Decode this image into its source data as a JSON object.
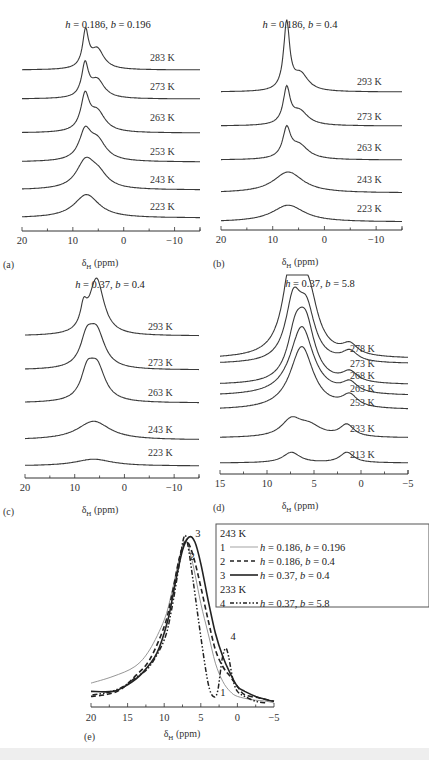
{
  "chart_data": [
    {
      "panel": "(a)",
      "type": "line",
      "title": "h = 0.186, b = 0.196",
      "title_parts": {
        "h": "0.186",
        "b": "0.196"
      },
      "xlabel": "δH (ppm)",
      "xlim": [
        20,
        -15
      ],
      "xticks": [
        20,
        10,
        0,
        -10
      ],
      "xtick_labels": [
        "20",
        "10",
        "0",
        "−10"
      ],
      "series": [
        {
          "name": "283 K",
          "peaks": [
            {
              "x": 7.5,
              "h": 1.0,
              "w": 0.7
            },
            {
              "x": 5.2,
              "h": 0.55,
              "w": 1.6
            }
          ],
          "base": 0.08
        },
        {
          "name": "273 K",
          "peaks": [
            {
              "x": 7.6,
              "h": 0.9,
              "w": 0.8
            },
            {
              "x": 5.2,
              "h": 0.5,
              "w": 1.7
            }
          ],
          "base": 0.08
        },
        {
          "name": "263 K",
          "peaks": [
            {
              "x": 7.6,
              "h": 0.95,
              "w": 1.0
            },
            {
              "x": 5.2,
              "h": 0.55,
              "w": 1.9
            }
          ],
          "base": 0.08
        },
        {
          "name": "253 K",
          "peaks": [
            {
              "x": 7.6,
              "h": 0.75,
              "w": 1.4
            },
            {
              "x": 5.2,
              "h": 0.55,
              "w": 2.1
            }
          ],
          "base": 0.08
        },
        {
          "name": "243 K",
          "peaks": [
            {
              "x": 7.5,
              "h": 0.75,
              "w": 2.2
            },
            {
              "x": 5.0,
              "h": 0.35,
              "w": 2.2
            }
          ],
          "base": 0.08
        },
        {
          "name": "223 K",
          "peaks": [
            {
              "x": 7.3,
              "h": 0.65,
              "w": 3.0
            }
          ],
          "base": 0.08
        }
      ]
    },
    {
      "panel": "(b)",
      "type": "line",
      "title": "h = 0.186, b = 0.4",
      "title_parts": {
        "h": "0.186",
        "b": "0.4"
      },
      "xlabel": "δH (ppm)",
      "xlim": [
        20,
        -15
      ],
      "xticks": [
        20,
        10,
        0,
        -10
      ],
      "xtick_labels": [
        "20",
        "10",
        "0",
        "−10"
      ],
      "series": [
        {
          "name": "293 K",
          "peaks": [
            {
              "x": 7.3,
              "h": 2.4,
              "w": 0.7
            },
            {
              "x": 4.6,
              "h": 0.6,
              "w": 1.8
            }
          ],
          "base": 0.06
        },
        {
          "name": "273 K",
          "peaks": [
            {
              "x": 7.3,
              "h": 1.25,
              "w": 0.8
            },
            {
              "x": 4.8,
              "h": 0.5,
              "w": 2.0
            }
          ],
          "base": 0.06
        },
        {
          "name": "263 K",
          "peaks": [
            {
              "x": 7.3,
              "h": 1.0,
              "w": 0.9
            },
            {
              "x": 4.9,
              "h": 0.5,
              "w": 2.2
            }
          ],
          "base": 0.06
        },
        {
          "name": "243 K",
          "peaks": [
            {
              "x": 7.0,
              "h": 0.75,
              "w": 3.5
            }
          ],
          "base": 0.06
        },
        {
          "name": "223 K",
          "peaks": [
            {
              "x": 7.0,
              "h": 0.6,
              "w": 3.8
            }
          ],
          "base": 0.06
        }
      ]
    },
    {
      "panel": "(c)",
      "type": "line",
      "title": "h = 0.37, b = 0.4",
      "title_parts": {
        "h": "0.37",
        "b": "0.4"
      },
      "xlabel": "δH (ppm)",
      "xlim": [
        20,
        -15
      ],
      "xticks": [
        20,
        10,
        0,
        -10
      ],
      "xtick_labels": [
        "20",
        "10",
        "0",
        "−10"
      ],
      "series": [
        {
          "name": "293 K",
          "peaks": [
            {
              "x": 8.2,
              "h": 0.6,
              "w": 0.8
            },
            {
              "x": 5.6,
              "h": 1.65,
              "w": 1.8
            }
          ],
          "base": 0.06
        },
        {
          "name": "273 K",
          "peaks": [
            {
              "x": 7.6,
              "h": 0.75,
              "w": 1.5
            },
            {
              "x": 5.6,
              "h": 1.05,
              "w": 2.0
            }
          ],
          "base": 0.06
        },
        {
          "name": "263 K",
          "peaks": [
            {
              "x": 7.5,
              "h": 0.75,
              "w": 1.5
            },
            {
              "x": 5.5,
              "h": 1.0,
              "w": 2.0
            }
          ],
          "base": 0.06
        },
        {
          "name": "243 K",
          "peaks": [
            {
              "x": 6.2,
              "h": 0.55,
              "w": 4.0
            }
          ],
          "base": 0.06
        },
        {
          "name": "223 K",
          "peaks": [
            {
              "x": 6.2,
              "h": 0.2,
              "w": 4.5
            }
          ],
          "base": 0.03
        }
      ]
    },
    {
      "panel": "(d)",
      "type": "line",
      "title": "h = 0.37, b = 5.8",
      "title_parts": {
        "h": "0.37",
        "b": "5.8"
      },
      "xlabel": "δH (ppm)",
      "xlim": [
        15,
        -5
      ],
      "xticks": [
        15,
        10,
        5,
        0,
        -5
      ],
      "xtick_labels": [
        "15",
        "10",
        "5",
        "0",
        "−5"
      ],
      "series": [
        {
          "name": "278 K",
          "peaks": [
            {
              "x": 7.3,
              "h": 3.2,
              "w": 1.1
            },
            {
              "x": 5.6,
              "h": 1.8,
              "w": 1.2
            },
            {
              "x": 1.2,
              "h": 0.35,
              "w": 1.0
            }
          ],
          "base": 0.06,
          "clip": 2.8
        },
        {
          "name": "273 K",
          "peaks": [
            {
              "x": 7.2,
              "h": 1.9,
              "w": 1.0
            },
            {
              "x": 5.8,
              "h": 1.6,
              "w": 1.1
            },
            {
              "x": 1.2,
              "h": 0.35,
              "w": 1.0
            }
          ],
          "base": 0.06
        },
        {
          "name": "268 K",
          "peaks": [
            {
              "x": 7.0,
              "h": 1.3,
              "w": 1.0
            },
            {
              "x": 5.9,
              "h": 1.9,
              "w": 1.2
            },
            {
              "x": 1.2,
              "h": 0.35,
              "w": 1.0
            }
          ],
          "base": 0.06
        },
        {
          "name": "263 K",
          "peaks": [
            {
              "x": 6.3,
              "h": 2.3,
              "w": 1.5
            },
            {
              "x": 1.2,
              "h": 0.35,
              "w": 1.0
            }
          ],
          "base": 0.06
        },
        {
          "name": "253 K",
          "peaks": [
            {
              "x": 6.3,
              "h": 2.1,
              "w": 1.5
            },
            {
              "x": 1.2,
              "h": 0.4,
              "w": 1.0
            }
          ],
          "base": 0.06
        },
        {
          "name": "233 K",
          "peaks": [
            {
              "x": 7.4,
              "h": 0.55,
              "w": 1.3
            },
            {
              "x": 5.5,
              "h": 0.35,
              "w": 1.6
            },
            {
              "x": 1.5,
              "h": 0.4,
              "w": 0.9
            }
          ],
          "base": 0.06
        },
        {
          "name": "213 K",
          "peaks": [
            {
              "x": 7.4,
              "h": 0.35,
              "w": 1.1
            },
            {
              "x": 1.5,
              "h": 0.35,
              "w": 0.9
            }
          ],
          "base": 0.06
        }
      ]
    },
    {
      "panel": "(e)",
      "type": "line",
      "xlabel": "δH (ppm)",
      "xlim": [
        20,
        -5
      ],
      "xticks": [
        20,
        15,
        10,
        5,
        0,
        -5
      ],
      "xtick_labels": [
        "20",
        "15",
        "10",
        "5",
        "0",
        "−5"
      ],
      "ylim": [
        0,
        1
      ],
      "legend_position": "top-right",
      "legend_groups": [
        {
          "header": "243 K",
          "entries": [
            {
              "num": "1",
              "style": "thin-solid",
              "h": "0.186",
              "b": "0.196"
            },
            {
              "num": "2",
              "style": "dashed",
              "h": "0.186",
              "b": "0.4"
            },
            {
              "num": "3",
              "style": "thick-solid",
              "h": "0.37",
              "b": "0.4"
            }
          ]
        },
        {
          "header": "233 K",
          "entries": [
            {
              "num": "4",
              "style": "dash-dot-dot",
              "h": "0.37",
              "b": "5.8"
            }
          ]
        }
      ],
      "series": [
        {
          "name": "1",
          "points": [
            [
              20,
              0.12
            ],
            [
              17,
              0.16
            ],
            [
              14,
              0.22
            ],
            [
              12,
              0.32
            ],
            [
              10,
              0.5
            ],
            [
              9,
              0.66
            ],
            [
              8,
              0.86
            ],
            [
              7.3,
              0.97
            ],
            [
              6.8,
              0.96
            ],
            [
              6,
              0.82
            ],
            [
              5,
              0.6
            ],
            [
              4,
              0.42
            ],
            [
              3,
              0.24
            ],
            [
              2,
              0.13
            ],
            [
              1,
              0.07
            ],
            [
              0,
              0.04
            ],
            [
              -2,
              0.02
            ],
            [
              -4,
              0.01
            ],
            [
              -5,
              0.0
            ]
          ]
        },
        {
          "name": "2",
          "points": [
            [
              20,
              0.04
            ],
            [
              18,
              0.05
            ],
            [
              16,
              0.08
            ],
            [
              14,
              0.16
            ],
            [
              12,
              0.26
            ],
            [
              10,
              0.46
            ],
            [
              9,
              0.64
            ],
            [
              8,
              0.86
            ],
            [
              7.4,
              0.95
            ],
            [
              6.8,
              0.97
            ],
            [
              6,
              0.88
            ],
            [
              5,
              0.7
            ],
            [
              4,
              0.5
            ],
            [
              3,
              0.32
            ],
            [
              2,
              0.22
            ],
            [
              1,
              0.16
            ],
            [
              0,
              0.1
            ],
            [
              -1,
              0.05
            ],
            [
              -3,
              0.03
            ],
            [
              -5,
              0.01
            ]
          ]
        },
        {
          "name": "3",
          "points": [
            [
              20,
              0.07
            ],
            [
              17,
              0.07
            ],
            [
              15,
              0.11
            ],
            [
              13,
              0.18
            ],
            [
              11,
              0.3
            ],
            [
              9.5,
              0.5
            ],
            [
              8.5,
              0.72
            ],
            [
              7.5,
              0.92
            ],
            [
              6.6,
              1.0
            ],
            [
              5.8,
              0.97
            ],
            [
              5,
              0.84
            ],
            [
              4,
              0.62
            ],
            [
              3,
              0.42
            ],
            [
              2,
              0.28
            ],
            [
              1,
              0.18
            ],
            [
              0,
              0.1
            ],
            [
              -1,
              0.07
            ],
            [
              -2.5,
              0.04
            ],
            [
              -4,
              0.02
            ],
            [
              -5,
              0.01
            ]
          ]
        },
        {
          "name": "4",
          "points": [
            [
              19.8,
              0.05
            ],
            [
              18,
              0.06
            ],
            [
              16,
              0.09
            ],
            [
              14,
              0.15
            ],
            [
              12,
              0.22
            ],
            [
              10,
              0.38
            ],
            [
              9,
              0.56
            ],
            [
              8,
              0.82
            ],
            [
              7.3,
              1.0
            ],
            [
              6.8,
              0.96
            ],
            [
              6,
              0.72
            ],
            [
              5,
              0.4
            ],
            [
              4,
              0.12
            ],
            [
              3.3,
              0.04
            ],
            [
              2.7,
              0.07
            ],
            [
              2.1,
              0.26
            ],
            [
              1.6,
              0.33
            ],
            [
              1.2,
              0.28
            ],
            [
              0.6,
              0.14
            ],
            [
              0,
              0.07
            ],
            [
              -1,
              0.04
            ],
            [
              -2.5,
              0.01
            ],
            [
              -4,
              0.0
            ]
          ]
        }
      ],
      "annotations": [
        {
          "text": "1",
          "x": 2.0,
          "y": 0.04
        },
        {
          "text": "2",
          "x": 6.2,
          "y": 0.86
        },
        {
          "text": "3",
          "x": 5.4,
          "y": 1.0
        },
        {
          "text": "4",
          "x": 0.6,
          "y": 0.38
        }
      ]
    }
  ]
}
